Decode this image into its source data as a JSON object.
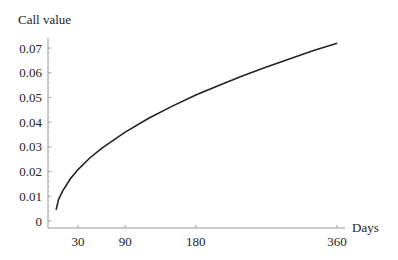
{
  "chart_data": {
    "type": "line",
    "title": "",
    "ylabel": "Call value",
    "xlabel": "Days",
    "x_ticks": [
      30,
      90,
      180,
      360
    ],
    "y_ticks": [
      0,
      0.01,
      0.02,
      0.03,
      0.04,
      0.05,
      0.06,
      0.07
    ],
    "y_tick_labels": [
      "0",
      "0.01",
      "0.02",
      "0.03",
      "0.04",
      "0.05",
      "0.06",
      "0.07"
    ],
    "xlim": [
      0,
      360
    ],
    "ylim": [
      0,
      0.07
    ],
    "grid": false,
    "legend": null,
    "series": [
      {
        "name": "Call value",
        "x": [
          2,
          5,
          10,
          20,
          30,
          45,
          60,
          90,
          120,
          150,
          180,
          210,
          240,
          270,
          300,
          330,
          360
        ],
        "values": [
          0.0045,
          0.0085,
          0.012,
          0.017,
          0.0208,
          0.0255,
          0.0294,
          0.036,
          0.0416,
          0.0465,
          0.051,
          0.055,
          0.0588,
          0.0624,
          0.0657,
          0.069,
          0.072
        ]
      }
    ]
  }
}
